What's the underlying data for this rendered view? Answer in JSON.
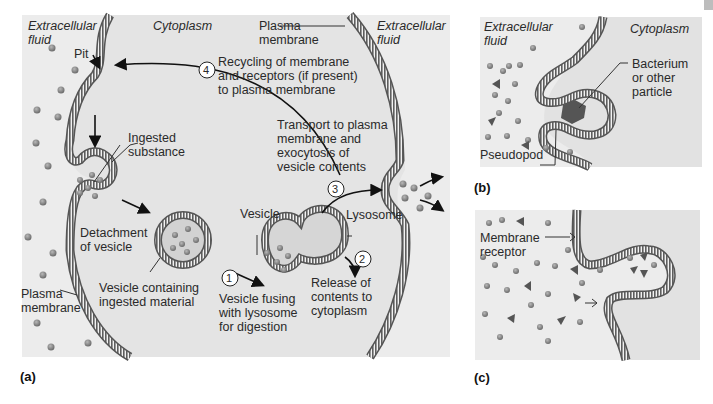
{
  "figure": {
    "panels": [
      {
        "id": "a",
        "label": "(a)"
      },
      {
        "id": "b",
        "label": "(b)"
      },
      {
        "id": "c",
        "label": "(c)"
      }
    ]
  },
  "panel_a": {
    "extracellular_left": "Extracellular\nfluid",
    "cytoplasm": "Cytoplasm",
    "plasma_membrane_top": "Plasma\nmembrane",
    "extracellular_right": "Extracellular\nfluid",
    "pit": "Pit",
    "step4_num": "4",
    "step4_text": "Recycling of membrane\nand receptors (if present)\nto plasma membrane",
    "ingested_substance": "Ingested\nsubstance",
    "transport_text": "Transport to plasma\nmembrane and\nexocytosis of\nvesicle contents",
    "step3_num": "3",
    "detachment": "Detachment\nof vesicle",
    "vesicle": "Vesicle",
    "lysosome": "Lysosome",
    "step1_num": "1",
    "step2_num": "2",
    "release": "Release of\ncontents to\ncytoplasm",
    "plasma_membrane_left": "Plasma\nmembrane",
    "vesicle_containing": "Vesicle containing\ningested material",
    "vesicle_fusing": "Vesicle fusing\nwith lysosome\nfor digestion"
  },
  "panel_b": {
    "extracellular": "Extracellular\nfluid",
    "cytoplasm": "Cytoplasm",
    "bacterium": "Bacterium\nor other\nparticle",
    "pseudopod": "Pseudopod"
  },
  "panel_c": {
    "membrane_receptor": "Membrane\nreceptor"
  },
  "colors": {
    "panel_bg": "#ececec",
    "cytoplasm_bg": "#e2e2e2",
    "membrane": "#6e6e6e",
    "particle": "#8a8a8a",
    "vesicle_fill": "#d0d0d0"
  }
}
